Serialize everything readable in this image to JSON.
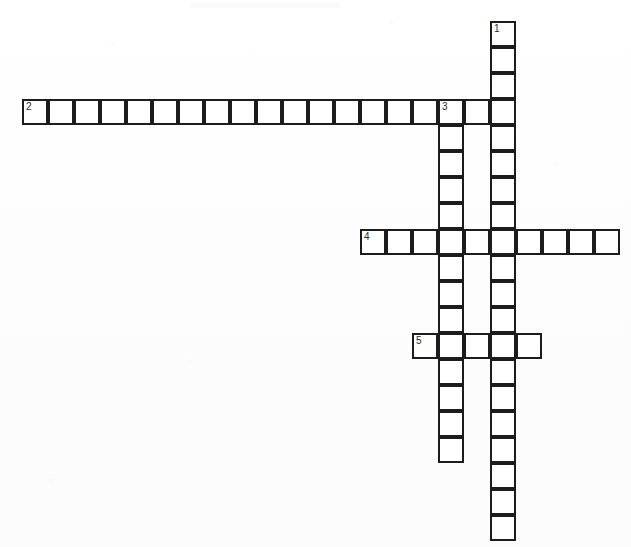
{
  "document": {
    "type": "crossword-puzzle-grid",
    "title": "",
    "background_color": "#ffffff",
    "cell_fill_color": "#ffffff",
    "cell_border_color": "#1c1c1c",
    "number_color": "#2a2a2a",
    "cell_size_px": 26,
    "grid_origin": {
      "x": 22,
      "y": 21
    }
  },
  "entries": [
    {
      "number": "1",
      "direction": "down",
      "label": "1",
      "start_col": 18,
      "start_row": 0,
      "length": 20,
      "clue": ""
    },
    {
      "number": "2",
      "direction": "across",
      "label": "2",
      "start_col": 0,
      "start_row": 3,
      "length": 19,
      "clue": ""
    },
    {
      "number": "3",
      "direction": "down",
      "label": "3",
      "start_col": 16,
      "start_row": 3,
      "length": 14,
      "clue": ""
    },
    {
      "number": "4",
      "direction": "across",
      "label": "4",
      "start_col": 13,
      "start_row": 8,
      "length": 10,
      "clue": ""
    },
    {
      "number": "5",
      "direction": "across",
      "label": "5",
      "start_col": 15,
      "start_row": 12,
      "length": 5,
      "clue": ""
    }
  ],
  "cell_letters": {}
}
